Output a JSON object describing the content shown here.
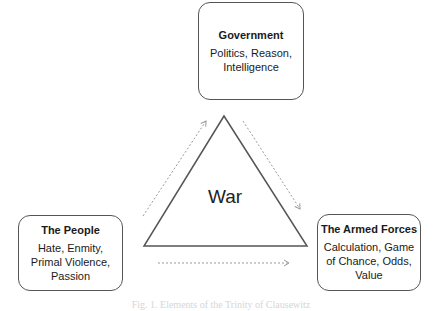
{
  "diagram": {
    "center_label": "War",
    "nodes": [
      {
        "id": "government",
        "title": "Government",
        "description": "Politics, Reason, Intelligence"
      },
      {
        "id": "people",
        "title": "The People",
        "description": "Hate, Enmity, Primal Violence, Passion"
      },
      {
        "id": "armed_forces",
        "title": "The Armed Forces",
        "description": "Calculation, Game of Chance, Odds, Value"
      }
    ],
    "edges": [
      {
        "from": "people",
        "to": "government",
        "style": "dotted-arrow"
      },
      {
        "from": "government",
        "to": "armed_forces",
        "style": "dotted-arrow"
      },
      {
        "from": "people",
        "to": "armed_forces",
        "style": "dotted-arrow"
      }
    ],
    "shape": "triangle",
    "colors": {
      "border": "#555555",
      "arrow": "#9a9a9a",
      "caption": "#d6d6d6"
    }
  },
  "caption": "Fig. 1. Elements of the Trinity of Clausewitz"
}
